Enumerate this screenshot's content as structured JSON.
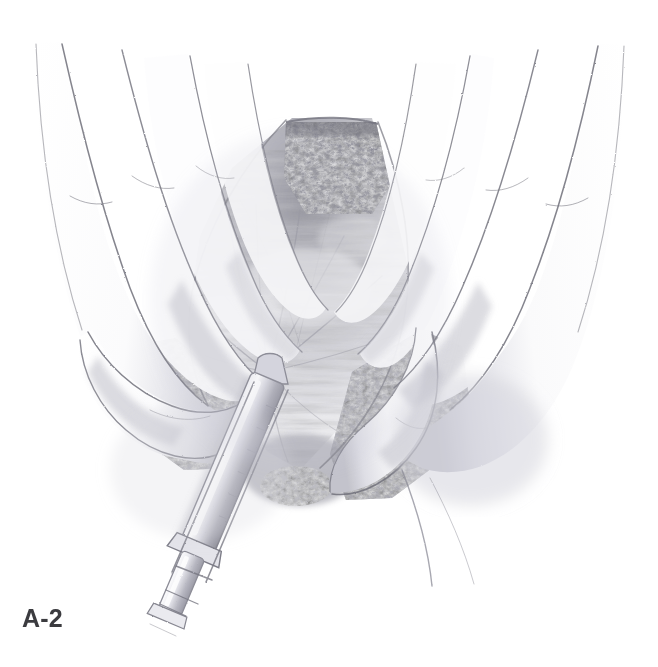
{
  "figure": {
    "label": "A-2",
    "alt_text": "Surgical illustration: gloved fingers retract the edges of an abdominal incision while a syringe with needle injects at the midline fascia",
    "background_color": "#ffffff",
    "label_color": "#3b3b3f",
    "canvas": {
      "width": 658,
      "height": 667
    }
  },
  "style": {
    "medium": "graphite pencil medical illustration",
    "palette": {
      "paper": "#ffffff",
      "line_dark": "#6e6e76",
      "line_mid": "#9a9aa2",
      "line_light": "#c9c9d0",
      "tissue_shadow": "#8a8a92",
      "tissue_mid": "#b4b4bc",
      "tissue_light": "#dcdce2",
      "fat_globule": "#f2f2f5",
      "instrument_steel": "#c4c4cc",
      "instrument_shadow": "#9b9ba4"
    }
  },
  "scene": {
    "title": "Abdominal wound exposure with local anesthetic infiltration",
    "elements": [
      {
        "name": "left-hand",
        "description": "Surgeon's left hand, four fingers descending from upper left, finger pad retracting left wound edge"
      },
      {
        "name": "right-hand",
        "description": "Assistant's right hand, fingers descending from upper right, retracting right wound edge"
      },
      {
        "name": "wound-cavity",
        "description": "Open vertical incision exposing subcutaneous fat and underlying fascia with radiating fibers"
      },
      {
        "name": "subcutaneous-fat",
        "description": "Globular fat lobules lining both cut skin edges"
      },
      {
        "name": "fascia",
        "description": "Central fascial plane with fibers converging toward needle insertion point"
      },
      {
        "name": "syringe",
        "description": "Syringe with needle entering fascia at center, barrel angled down and to the left, plunger and flange at lower left"
      },
      {
        "name": "needle-insertion-point",
        "description": "Point where needle pierces fascia, fibers tent around it"
      }
    ]
  }
}
